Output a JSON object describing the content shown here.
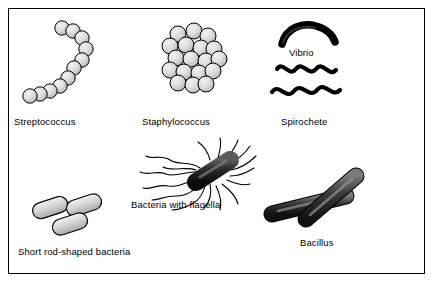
{
  "figure": {
    "background_color": "#ffffff",
    "border_color": "#000000",
    "cell_fill_color": "#d9d9d9",
    "cell_outline_color": "#000000",
    "label_color": "#000000"
  },
  "labels": {
    "streptococcus": "Streptococcus",
    "staphylococcus": "Staphylococcus",
    "spirochete": "Spirochete",
    "vibrio": "Vibrio",
    "flagella": "Bacteria with flagella",
    "short_rod": "Short rod-shaped bacteria",
    "bacillus": "Bacillus"
  },
  "shapes": [
    {
      "name": "streptococcus",
      "description": "chain of round cocci in a curved line",
      "count": 11
    },
    {
      "name": "staphylococcus",
      "description": "irregular grape-like cluster of cocci",
      "count": 17
    },
    {
      "name": "vibrio",
      "description": "single comma-shaped curved rod"
    },
    {
      "name": "spirochete",
      "description": "two long wavy corkscrew filaments"
    },
    {
      "name": "bacteria-with-flagella",
      "description": "rod with many trailing flagella"
    },
    {
      "name": "short-rod-shaped-bacteria",
      "description": "three short capsule-shaped rods"
    },
    {
      "name": "bacillus",
      "description": "two long crossed rods"
    }
  ]
}
